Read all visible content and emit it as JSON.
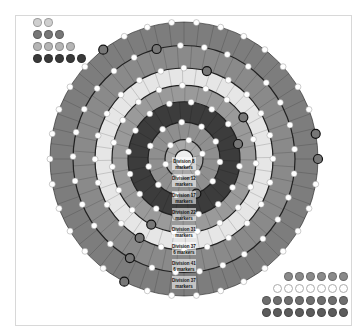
{
  "board": {
    "center": [
      184,
      159
    ],
    "rings": [
      {
        "outer_r": 134,
        "color": "#7d7d7d",
        "segments": 56
      },
      {
        "outer_r": 111,
        "color": "#8a8a8a",
        "segments": 48
      },
      {
        "outer_r": 89,
        "color": "#e6e6e6",
        "segments": 40
      },
      {
        "outer_r": 72,
        "color": "#9a9a9a",
        "segments": 32
      },
      {
        "outer_r": 56,
        "color": "#3c3c3c",
        "segments": 26
      },
      {
        "outer_r": 36,
        "color": "#8f8f8f",
        "segments": 18
      },
      {
        "outer_r": 19,
        "color": "#a8a8a8",
        "segments": 10
      },
      {
        "outer_r": 9,
        "color": "#eeeeee",
        "segments": 1
      }
    ],
    "labels": [
      "Division 8 markers",
      "Division 12 markers",
      "Division 17 markers",
      "Division 22 markers",
      "Division 31 markers",
      "Division 37 6 markers",
      "Division 41 6 markers",
      "Division 37 markers"
    ]
  },
  "pools": {
    "top_left": [
      {
        "count": 2,
        "color": "#cfcfcf"
      },
      {
        "count": 3,
        "color": "#777777"
      },
      {
        "count": 4,
        "color": "#b5b5b5"
      },
      {
        "count": 5,
        "color": "#3a3a3a"
      }
    ],
    "bottom_right": [
      {
        "count": 6,
        "color": "#8a8a8a"
      },
      {
        "count": 7,
        "color": "#ffffff"
      },
      {
        "count": 8,
        "color": "#6e6e6e"
      },
      {
        "count": 8,
        "color": "#5c5c5c"
      }
    ]
  }
}
